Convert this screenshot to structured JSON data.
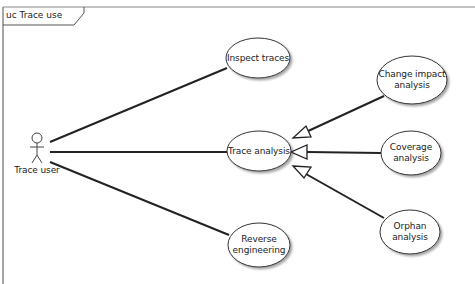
{
  "frame": {
    "title": "uc Trace use"
  },
  "actor": {
    "name": "Trace user"
  },
  "use_cases": [
    {
      "id": "inspect",
      "label": "Inspect traces",
      "cx": 258,
      "cy": 58,
      "rx": 32,
      "ry": 20
    },
    {
      "id": "trace",
      "label": "Trace analysis",
      "cx": 259,
      "cy": 151,
      "rx": 32,
      "ry": 20
    },
    {
      "id": "reverse",
      "label_lines": [
        "Reverse",
        "engineering"
      ],
      "cx": 259,
      "cy": 245,
      "rx": 31,
      "ry": 22
    },
    {
      "id": "change",
      "label_lines": [
        "Change impact",
        "analysis"
      ],
      "cx": 412,
      "cy": 80,
      "rx": 34,
      "ry": 24
    },
    {
      "id": "coverage",
      "label_lines": [
        "Coverage",
        "analysis"
      ],
      "cx": 411,
      "cy": 153,
      "rx": 30,
      "ry": 22
    },
    {
      "id": "orphan",
      "label_lines": [
        "Orphan",
        "analysis"
      ],
      "cx": 410,
      "cy": 232,
      "rx": 30,
      "ry": 22
    }
  ],
  "associations": [
    {
      "from": "Trace user",
      "to": "Inspect traces"
    },
    {
      "from": "Trace user",
      "to": "Trace analysis"
    },
    {
      "from": "Trace user",
      "to": "Reverse engineering"
    }
  ],
  "generalizations": [
    {
      "from": "Change impact analysis",
      "to": "Trace analysis"
    },
    {
      "from": "Coverage analysis",
      "to": "Trace analysis"
    },
    {
      "from": "Orphan analysis",
      "to": "Trace analysis"
    }
  ],
  "colors": {
    "line": "#222222",
    "frame": "#888888",
    "ellipse_fill": "#ffffff",
    "ellipse_stroke": "#333333"
  }
}
